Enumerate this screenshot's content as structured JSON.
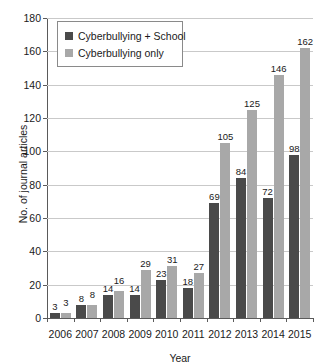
{
  "chart_data": {
    "type": "bar",
    "title": "",
    "xlabel": "Year",
    "ylabel": "No. of journal articles",
    "categories": [
      "2006",
      "2007",
      "2008",
      "2009",
      "2010",
      "2011",
      "2012",
      "2013",
      "2014",
      "2015"
    ],
    "series": [
      {
        "name": "Cyberbullying + School",
        "color": "#4a4a4a",
        "values": [
          3,
          8,
          14,
          14,
          23,
          18,
          69,
          84,
          72,
          98
        ]
      },
      {
        "name": "Cyberbullying only",
        "color": "#a8a8a8",
        "values": [
          3,
          8,
          16,
          29,
          31,
          27,
          105,
          125,
          146,
          162
        ]
      }
    ],
    "ylim": [
      0,
      180
    ],
    "ytick_step": 20,
    "yticks": [
      0,
      20,
      40,
      60,
      80,
      100,
      120,
      140,
      160,
      180
    ],
    "grid": true,
    "data_labels": true,
    "legend_position": "top-left-inside"
  }
}
